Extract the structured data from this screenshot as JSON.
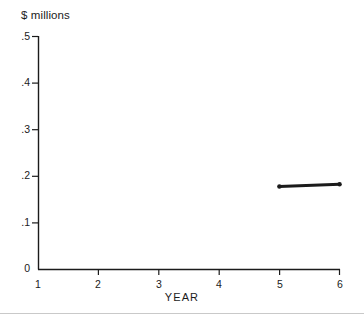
{
  "chart_data": {
    "type": "line",
    "title": "",
    "subtitle": "",
    "xlabel": "YEAR",
    "ylabel": "$ millions",
    "xlim": [
      1,
      6
    ],
    "ylim": [
      0,
      0.5
    ],
    "grid": false,
    "legend": false,
    "legend_position": "none",
    "xticks": [
      1,
      2,
      3,
      4,
      5,
      6
    ],
    "xticklabels": [
      "1",
      "2",
      "3",
      "4",
      "5",
      "6"
    ],
    "yticks": [
      0,
      0.1,
      0.2,
      0.3,
      0.4,
      0.5
    ],
    "yticklabels": [
      "0",
      ".1",
      ".2",
      ".3",
      ".4",
      ".5"
    ],
    "series": [
      {
        "name": "value",
        "color": "#1b1b1b",
        "linewidth": 3,
        "x": [
          5,
          6
        ],
        "values": [
          0.178,
          0.183
        ]
      }
    ],
    "annotations": []
  },
  "figure": {
    "unit_label": "$ millions",
    "xaxis_title": "YEAR"
  }
}
